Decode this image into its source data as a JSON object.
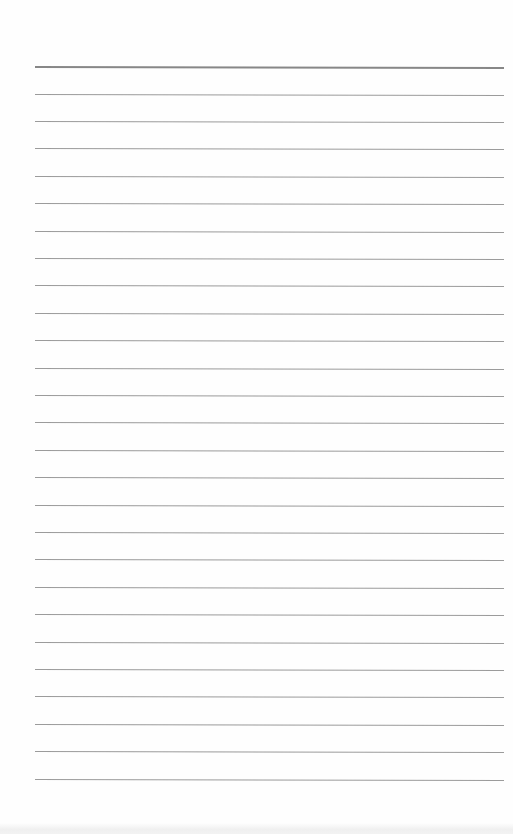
{
  "document": {
    "type": "blank ruled notebook page",
    "header_rule": {
      "y": 66,
      "thickness": 2
    },
    "rules": {
      "count": 26,
      "first_y": 93.5,
      "spacing": 27.4,
      "left": 35,
      "right": 504
    },
    "text_content": "",
    "colors": {
      "paper": "#fefefe",
      "rule": "#8a8a8a",
      "header_rule": "#7a7a7a"
    }
  }
}
